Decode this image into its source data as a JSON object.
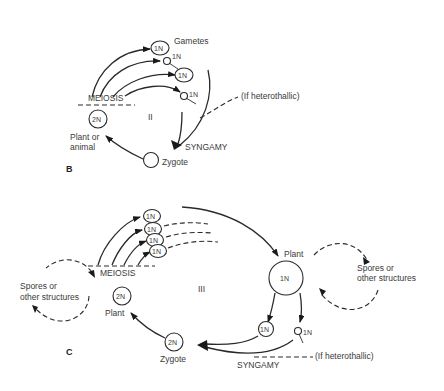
{
  "diagramB": {
    "panel_label": "B",
    "cycle_number": "II",
    "meiosis": "MEIOSIS",
    "gametes": "Gametes",
    "gamete_labels": [
      "1N",
      "1N",
      "1N",
      "1N"
    ],
    "diploid_label": "2N",
    "organism_line1": "Plant or",
    "organism_line2": "animal",
    "zygote": "Zygote",
    "syngamy": "SYNGAMY",
    "heterothallic": "(If heterothallic)"
  },
  "diagramC": {
    "panel_label": "C",
    "cycle_number": "III",
    "meiosis": "MEIOSIS",
    "spore_labels": [
      "1N",
      "1N",
      "1N",
      "1N"
    ],
    "diploid_plant_label": "2N",
    "diploid_plant": "Plant",
    "haploid_plant": "Plant",
    "haploid_plant_label": "1N",
    "left_loop_line1": "Spores or",
    "left_loop_line2": "other structures",
    "right_loop_line1": "Spores or",
    "right_loop_line2": "other structures",
    "gamete_labels": [
      "1N",
      "1N"
    ],
    "zygote_label": "2N",
    "zygote": "Zygote",
    "syngamy": "SYNGAMY",
    "heterothallic": "(If heterothallic)"
  }
}
